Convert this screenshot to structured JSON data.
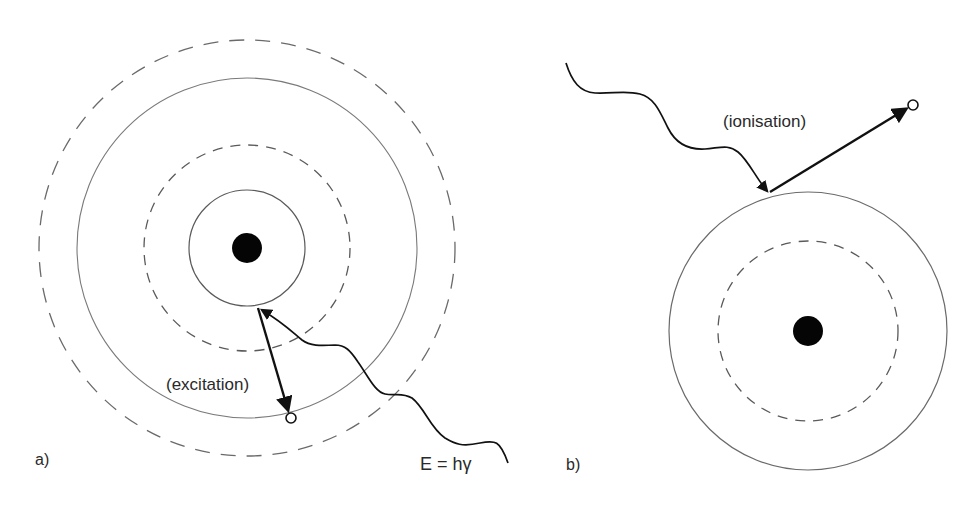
{
  "panels": [
    {
      "id": "a",
      "label": "a)",
      "process_label": "(excitation)",
      "photon_label": "E = hγ",
      "nucleus": {
        "cx": 247,
        "cy": 248,
        "r": 15
      },
      "shells": [
        {
          "r": 58,
          "style": "solid"
        },
        {
          "r": 103,
          "style": "dashed"
        },
        {
          "r": 170,
          "style": "solid"
        },
        {
          "r": 208,
          "style": "dashed"
        }
      ]
    },
    {
      "id": "b",
      "label": "b)",
      "process_label": "(ionisation)",
      "nucleus": {
        "cx": 808,
        "cy": 331,
        "r": 15
      },
      "shells": [
        {
          "r": 90,
          "style": "dashed"
        },
        {
          "r": 139,
          "style": "solid"
        }
      ]
    }
  ],
  "colors": {
    "background": "#ffffff",
    "line": "#6a6a6a",
    "ink": "#111111",
    "text": "#2a2a2a"
  }
}
